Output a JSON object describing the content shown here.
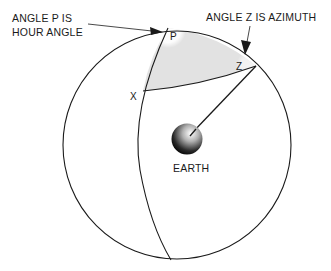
{
  "diagram": {
    "labels": {
      "hour_angle_line1": "ANGLE  P  IS",
      "hour_angle_line2": "HOUR ANGLE",
      "azimuth": "ANGLE  Z  IS  AZIMUTH",
      "vertex_p": "P",
      "vertex_z": "Z",
      "vertex_x": "X",
      "earth": "EARTH"
    },
    "colors": {
      "stroke": "#1a1a1a",
      "triangle_fill": "#e2e2e2",
      "background": "#ffffff"
    }
  }
}
